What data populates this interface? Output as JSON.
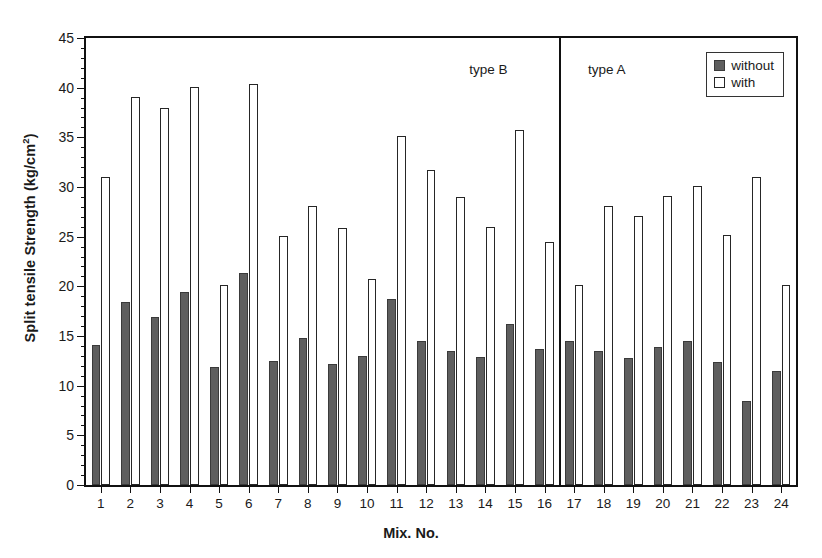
{
  "chart_data": {
    "type": "bar",
    "title": "",
    "xlabel": "Mix. No.",
    "ylabel": "Split tensile Strength (kg/cm2)",
    "ylabel_main": "Split tensile Strength (kg/cm",
    "ylabel_sup": "2",
    "ylabel_tail": ")",
    "categories": [
      "1",
      "2",
      "3",
      "4",
      "5",
      "6",
      "7",
      "8",
      "9",
      "10",
      "11",
      "12",
      "13",
      "14",
      "15",
      "16",
      "17",
      "18",
      "19",
      "20",
      "21",
      "22",
      "23",
      "24"
    ],
    "series": [
      {
        "name": "without",
        "color": "#5e5e5e",
        "values": [
          14.1,
          18.4,
          16.9,
          19.4,
          11.9,
          21.3,
          12.5,
          14.8,
          12.2,
          13.0,
          18.7,
          14.5,
          13.5,
          12.9,
          16.2,
          13.7,
          14.5,
          13.5,
          12.8,
          13.9,
          14.5,
          12.4,
          8.5,
          11.5
        ]
      },
      {
        "name": "with",
        "color": "#ffffff",
        "values": [
          31.0,
          39.1,
          38.0,
          40.1,
          20.1,
          40.4,
          25.1,
          28.1,
          25.9,
          20.7,
          35.1,
          31.7,
          29.0,
          26.0,
          35.7,
          24.5,
          20.1,
          28.1,
          27.1,
          29.1,
          30.1,
          25.2,
          31.0,
          20.1
        ]
      }
    ],
    "ylim": [
      0,
      45
    ],
    "ytick_step": 5,
    "yticks": [
      0,
      5,
      10,
      15,
      20,
      25,
      30,
      35,
      40,
      45
    ],
    "yminor_step": 1,
    "grid": false,
    "legend": {
      "position": "top-right",
      "entries": [
        {
          "label": "without",
          "swatch": "without"
        },
        {
          "label": "with",
          "swatch": "with"
        }
      ]
    },
    "annotations": [
      {
        "name": "type-b-label",
        "text": "type B",
        "at_category": 13.6
      },
      {
        "name": "type-a-label",
        "text": "type A",
        "at_category": 17.6
      }
    ],
    "divider": {
      "name": "group-divider",
      "after_category": 16
    }
  }
}
